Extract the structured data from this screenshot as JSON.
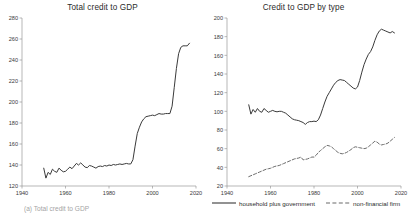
{
  "figure": {
    "caption_partial": "(a) Total credit to GDP"
  },
  "legend": {
    "items": [
      {
        "label": "household plus government",
        "style": "solid",
        "key": "legend-key-solid"
      },
      {
        "label": "non-financial firm",
        "style": "dashed",
        "key": "legend-key-dashed"
      }
    ]
  },
  "chart_data": [
    {
      "type": "line",
      "title": "Total credit to GDP",
      "xlabel": "",
      "ylabel": "",
      "xlim": [
        1940,
        2020
      ],
      "ylim": [
        120,
        280
      ],
      "xticks": [
        1940,
        1960,
        1980,
        2000,
        2020
      ],
      "yticks": [
        120,
        140,
        160,
        180,
        200,
        220,
        240,
        260,
        280
      ],
      "grid": false,
      "legend_position": "none",
      "series": [
        {
          "name": "total credit to GDP",
          "style": "solid",
          "color": "#3a3a3a",
          "x": [
            1950,
            1951,
            1952,
            1953,
            1954,
            1955,
            1956,
            1957,
            1958,
            1959,
            1960,
            1961,
            1962,
            1963,
            1964,
            1965,
            1966,
            1967,
            1968,
            1969,
            1970,
            1971,
            1972,
            1973,
            1974,
            1975,
            1976,
            1977,
            1978,
            1979,
            1980,
            1981,
            1982,
            1983,
            1984,
            1985,
            1986,
            1987,
            1988,
            1989,
            1990,
            1991,
            1992,
            1993,
            1994,
            1995,
            1996,
            1997,
            1998,
            1999,
            2000,
            2001,
            2002,
            2003,
            2004,
            2005,
            2006,
            2007,
            2008,
            2009,
            2010,
            2011,
            2012,
            2013,
            2014,
            2015,
            2016,
            2017
          ],
          "y": [
            137,
            127.5,
            133,
            131,
            136,
            134,
            133,
            137,
            135,
            133.5,
            134,
            136,
            138,
            136.5,
            139,
            141.5,
            140,
            142,
            140,
            138,
            137.5,
            139.5,
            139,
            138,
            137,
            138.5,
            139,
            138.5,
            139.5,
            139,
            140,
            139.5,
            140.5,
            140,
            140.5,
            141,
            140.5,
            141,
            141.5,
            141,
            141,
            145,
            158,
            170,
            176,
            181,
            184,
            186,
            186.5,
            187,
            187.5,
            187,
            188,
            189,
            188.5,
            188.5,
            189,
            189,
            189,
            196,
            214,
            232,
            246,
            252,
            253.5,
            253.5,
            253.5,
            256
          ]
        }
      ]
    },
    {
      "type": "line",
      "title": "Credit to GDP by type",
      "xlabel": "",
      "ylabel": "",
      "xlim": [
        1940,
        2020
      ],
      "ylim": [
        20,
        200
      ],
      "xticks": [
        1940,
        1960,
        1980,
        2000,
        2020
      ],
      "yticks": [
        20,
        40,
        60,
        80,
        100,
        120,
        140,
        160,
        180,
        200
      ],
      "grid": false,
      "legend_position": "bottom",
      "series": [
        {
          "name": "household plus government",
          "style": "solid",
          "color": "#3a3a3a",
          "x": [
            1950,
            1951,
            1952,
            1953,
            1954,
            1955,
            1956,
            1957,
            1958,
            1959,
            1960,
            1961,
            1962,
            1963,
            1964,
            1965,
            1966,
            1967,
            1968,
            1969,
            1970,
            1971,
            1972,
            1973,
            1974,
            1975,
            1976,
            1977,
            1978,
            1979,
            1980,
            1981,
            1982,
            1983,
            1984,
            1985,
            1986,
            1987,
            1988,
            1989,
            1990,
            1991,
            1992,
            1993,
            1994,
            1995,
            1996,
            1997,
            1998,
            1999,
            2000,
            2001,
            2002,
            2003,
            2004,
            2005,
            2006,
            2007,
            2008,
            2009,
            2010,
            2011,
            2012,
            2013,
            2014,
            2015,
            2016,
            2017
          ],
          "y": [
            107,
            97,
            102,
            99,
            103,
            100,
            99,
            103,
            101,
            99,
            100,
            101,
            100,
            99.5,
            100,
            100,
            99,
            98,
            96,
            94,
            92,
            91,
            90.5,
            90,
            89,
            88,
            86,
            88,
            89,
            89,
            89.5,
            89,
            91,
            96,
            103,
            110,
            116,
            120,
            124,
            128,
            131,
            133,
            134,
            133.5,
            133,
            131,
            129,
            127,
            125,
            124,
            126,
            133,
            142,
            150,
            156,
            161,
            164,
            169,
            176,
            182,
            186,
            188,
            187,
            186,
            185,
            184,
            185.5,
            184
          ]
        },
        {
          "name": "non-financial firm",
          "style": "dashed",
          "color": "#6b6b6b",
          "x": [
            1950,
            1951,
            1952,
            1953,
            1954,
            1955,
            1956,
            1957,
            1958,
            1959,
            1960,
            1961,
            1962,
            1963,
            1964,
            1965,
            1966,
            1967,
            1968,
            1969,
            1970,
            1971,
            1972,
            1973,
            1974,
            1975,
            1976,
            1977,
            1978,
            1979,
            1980,
            1981,
            1982,
            1983,
            1984,
            1985,
            1986,
            1987,
            1988,
            1989,
            1990,
            1991,
            1992,
            1993,
            1994,
            1995,
            1996,
            1997,
            1998,
            1999,
            2000,
            2001,
            2002,
            2003,
            2004,
            2005,
            2006,
            2007,
            2008,
            2009,
            2010,
            2011,
            2012,
            2013,
            2014,
            2015,
            2016,
            2017
          ],
          "y": [
            30,
            31,
            32,
            33,
            34,
            35,
            36,
            37,
            38,
            38.5,
            39,
            40,
            41,
            41.5,
            42,
            43,
            44,
            45,
            46,
            47,
            48,
            49,
            49.5,
            50,
            51,
            48,
            48.5,
            49,
            50,
            51,
            51,
            53,
            56,
            58,
            60,
            62,
            63.5,
            63,
            62,
            60,
            58,
            56,
            55,
            54.5,
            55,
            56,
            57.5,
            59,
            61,
            62,
            61.5,
            61,
            60.5,
            60,
            60.5,
            62,
            64,
            66,
            68,
            67,
            65,
            64,
            64.5,
            65,
            66,
            68,
            70,
            72
          ]
        }
      ]
    }
  ]
}
